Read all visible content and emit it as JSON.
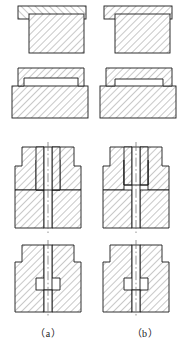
{
  "figure": {
    "kind": "engineering-section-drawing",
    "rows": 4,
    "columns": 2,
    "line_color": "#1a1a1a",
    "hatch_color": "#555555",
    "fill_color": "#ffffff",
    "centerline_color": "#666666",
    "captions": [
      {
        "key": "a",
        "label": "（a）"
      },
      {
        "key": "b",
        "label": "（b）"
      }
    ],
    "views": [
      {
        "id": "row1-col-a",
        "row": 1,
        "column": "a",
        "title": "Flat bar over block, hatch right-leaning",
        "parts": [
          {
            "name": "top-plate",
            "hatch_direction": "left",
            "shape": "rectangle"
          },
          {
            "name": "lower-block",
            "hatch_direction": "right",
            "shape": "rectangle"
          }
        ]
      },
      {
        "id": "row1-col-b",
        "row": 1,
        "column": "b",
        "title": "Flat bar over block, hatch left-leaning",
        "parts": [
          {
            "name": "top-plate",
            "hatch_direction": "right",
            "shape": "rectangle"
          },
          {
            "name": "lower-block",
            "hatch_direction": "right",
            "shape": "rectangle"
          }
        ]
      },
      {
        "id": "row2-col-a",
        "row": 2,
        "column": "a",
        "title": "Stepped plate seated on base block",
        "parts": [
          {
            "name": "top-plate",
            "hatch_direction": "right",
            "shape": "stepped"
          },
          {
            "name": "base-block",
            "hatch_direction": "right",
            "shape": "rectangle"
          }
        ]
      },
      {
        "id": "row2-col-b",
        "row": 2,
        "column": "b",
        "title": "Stepped plate seated on base block, recessed seat",
        "parts": [
          {
            "name": "top-plate",
            "hatch_direction": "right",
            "shape": "stepped"
          },
          {
            "name": "base-block",
            "hatch_direction": "right",
            "shape": "rectangle"
          }
        ]
      },
      {
        "id": "row3-col-a",
        "row": 3,
        "column": "a",
        "title": "Bored block with counterbore, centerline through axis",
        "parts": [
          {
            "name": "body-block",
            "hatch_direction": "right",
            "shape": "rectangle"
          },
          {
            "name": "counterbore",
            "hatch_direction": "none",
            "shape": "bore"
          },
          {
            "name": "centerline",
            "hatch_direction": "none",
            "shape": "axis"
          }
        ]
      },
      {
        "id": "row3-col-b",
        "row": 3,
        "column": "b",
        "title": "Bored block with wider counterbore, centerline through axis",
        "parts": [
          {
            "name": "body-block",
            "hatch_direction": "right",
            "shape": "rectangle"
          },
          {
            "name": "counterbore",
            "hatch_direction": "none",
            "shape": "bore"
          },
          {
            "name": "centerline",
            "hatch_direction": "none",
            "shape": "axis"
          }
        ]
      },
      {
        "id": "row4-col-a",
        "row": 4,
        "column": "a",
        "title": "Stepped bore block, narrow through-hole",
        "parts": [
          {
            "name": "body-block",
            "hatch_direction": "right",
            "shape": "rectangle"
          },
          {
            "name": "stepped-bore",
            "hatch_direction": "none",
            "shape": "bore"
          },
          {
            "name": "centerline",
            "hatch_direction": "none",
            "shape": "axis"
          }
        ]
      },
      {
        "id": "row4-col-b",
        "row": 4,
        "column": "b",
        "title": "Stepped bore block, narrow through-hole, alternate seat",
        "parts": [
          {
            "name": "body-block",
            "hatch_direction": "right",
            "shape": "rectangle"
          },
          {
            "name": "stepped-bore",
            "hatch_direction": "none",
            "shape": "bore"
          },
          {
            "name": "centerline",
            "hatch_direction": "none",
            "shape": "axis"
          }
        ]
      }
    ]
  }
}
